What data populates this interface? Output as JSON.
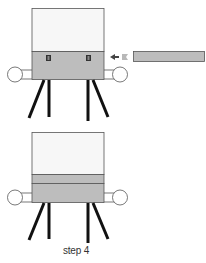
{
  "diagram": {
    "caption": "step 4",
    "colors": {
      "box_top": "#f7f7f7",
      "box_fill_gray": "#bdbdbd",
      "outline": "#555555",
      "legs": "#111111",
      "arrow_dark": "#444444",
      "arrow_light": "#b8b8b8",
      "insert_panel": "#bdbdbd"
    },
    "panels": [
      {
        "id": "top",
        "label": "before-insertion",
        "has_screws": true,
        "has_insert_arrow": true,
        "separate_panel": "gray slat being slid in"
      },
      {
        "id": "bottom",
        "label": "after-insertion",
        "has_screws": false,
        "has_insert_arrow": false,
        "inserted_panel": "gray slat installed"
      }
    ]
  }
}
